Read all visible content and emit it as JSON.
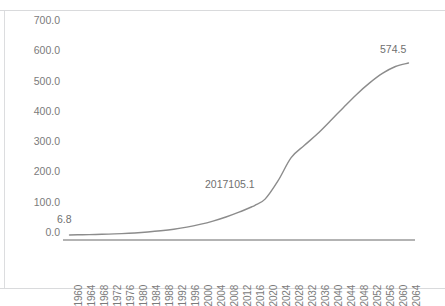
{
  "chart_data": {
    "type": "line",
    "title": "",
    "subtitle": "",
    "xlabel": "",
    "ylabel": "",
    "grid": false,
    "legend": false,
    "legend_position": "none",
    "line_color": "#8c8c8c",
    "xlim": [
      1960,
      2064
    ],
    "ylim": [
      0.0,
      700.0
    ],
    "y_ticks": [
      "700.0",
      "600.0",
      "500.0",
      "400.0",
      "300.0",
      "200.0",
      "100.0",
      "0.0"
    ],
    "y_tick_values": [
      700.0,
      600.0,
      500.0,
      400.0,
      300.0,
      200.0,
      100.0,
      0.0
    ],
    "x_ticks": [
      "1960",
      "1964",
      "1968",
      "1972",
      "1976",
      "1980",
      "1984",
      "1988",
      "1992",
      "1996",
      "2000",
      "2004",
      "2008",
      "2012",
      "2016",
      "2020",
      "2024",
      "2028",
      "2032",
      "2036",
      "2040",
      "2044",
      "2048",
      "2052",
      "2056",
      "2060",
      "2064"
    ],
    "x": [
      1960,
      1964,
      1968,
      1972,
      1976,
      1980,
      1984,
      1988,
      1992,
      1996,
      2000,
      2004,
      2008,
      2012,
      2016,
      2017,
      2020,
      2024,
      2028,
      2032,
      2036,
      2040,
      2044,
      2048,
      2052,
      2056,
      2060,
      2064
    ],
    "values": [
      6.8,
      7.5,
      8.4,
      9.6,
      11.2,
      13.4,
      16.5,
      20.5,
      25.6,
      32.5,
      41.5,
      52.5,
      66.0,
      82.0,
      100.0,
      105.1,
      125.0,
      186.0,
      262.0,
      302.0,
      340.0,
      383.0,
      427.0,
      470.0,
      508.0,
      540.0,
      563.0,
      574.5
    ],
    "annotations": [
      {
        "name": "start-value",
        "text": "6.8",
        "x": 1960,
        "y": 6.8
      },
      {
        "name": "mid-value",
        "text": "2017105.1",
        "x": 2017,
        "y": 105.1
      },
      {
        "name": "end-value",
        "text": "574.5",
        "x": 2064,
        "y": 574.5
      }
    ]
  }
}
